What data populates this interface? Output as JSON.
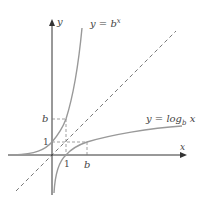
{
  "diagram": {
    "axes": {
      "x_label": "x",
      "y_label": "y"
    },
    "curves": {
      "exp_label": "y = b",
      "exp_sup": "x",
      "log_label": "y = log",
      "log_sub": "b",
      "log_tail": " x"
    },
    "ticks": {
      "x_one": "1",
      "x_b": "b",
      "y_one": "1",
      "y_b": "b"
    },
    "colors": {
      "curve": "#999999",
      "axis": "#333333",
      "dash": "#555555"
    }
  }
}
